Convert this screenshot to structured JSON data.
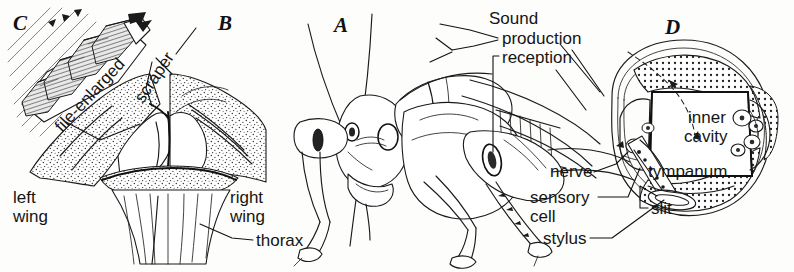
{
  "figure": {
    "background_color": "#fdfdfb",
    "ink_color": "#1a1a1a"
  },
  "panels": [
    {
      "id": "C",
      "letter": "C",
      "subject": "file-enlarged detail of stridulatory pegs"
    },
    {
      "id": "B",
      "letter": "B",
      "subject": "wing bases showing file and scraper"
    },
    {
      "id": "A",
      "letter": "A",
      "subject": "grasshopper head and thorax, lateral view"
    },
    {
      "id": "D",
      "letter": "D",
      "subject": "cross-section of tympanal hearing organ"
    }
  ],
  "labels": {
    "file_enlarged": "file-enlarged",
    "scraper": "scraper",
    "left_wing_line1": "left",
    "left_wing_line2": "wing",
    "right_wing_line1": "right",
    "right_wing_line2": "wing",
    "thorax": "thorax",
    "sound": "Sound",
    "production": "production",
    "reception": "reception",
    "inner_line1": "inner",
    "inner_line2": "cavity",
    "tympanum": "tympanum",
    "slit": "slit",
    "nerve": "nerve",
    "sensory_line1": "sensory",
    "sensory_line2": "cell",
    "stylus": "stylus"
  }
}
